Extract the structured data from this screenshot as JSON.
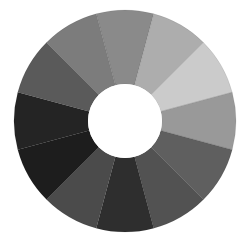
{
  "image": {
    "subject": "grayscale color wheel (ring of 12 tonal segments)",
    "width": 248,
    "height": 233,
    "background": "#ffffff"
  },
  "wheel": {
    "center": [
      125,
      121
    ],
    "outer_radius": 111,
    "inner_radius": 37,
    "hole_color": "#ffffff",
    "segments": [
      {
        "start_deg": -15,
        "end_deg": 15,
        "color": "#8a8a8a"
      },
      {
        "start_deg": 15,
        "end_deg": 45,
        "color": "#adadad"
      },
      {
        "start_deg": 45,
        "end_deg": 75,
        "color": "#cbcbcb"
      },
      {
        "start_deg": 75,
        "end_deg": 105,
        "color": "#999999"
      },
      {
        "start_deg": 105,
        "end_deg": 135,
        "color": "#5f5f5f"
      },
      {
        "start_deg": 135,
        "end_deg": 165,
        "color": "#525252"
      },
      {
        "start_deg": 165,
        "end_deg": 195,
        "color": "#2e2e2e"
      },
      {
        "start_deg": 195,
        "end_deg": 225,
        "color": "#4b4b4b"
      },
      {
        "start_deg": 225,
        "end_deg": 255,
        "color": "#1d1d1d"
      },
      {
        "start_deg": 255,
        "end_deg": 285,
        "color": "#242424"
      },
      {
        "start_deg": 285,
        "end_deg": 315,
        "color": "#5a5a5a"
      },
      {
        "start_deg": 315,
        "end_deg": 345,
        "color": "#7c7c7c"
      }
    ]
  }
}
